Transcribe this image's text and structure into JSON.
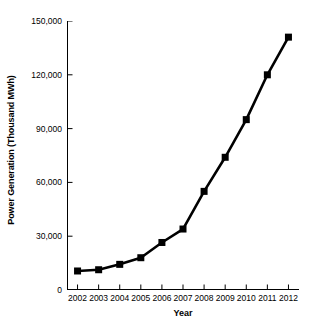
{
  "chart_data": {
    "type": "line",
    "title": "",
    "subtitle": "",
    "xlabel": "Year",
    "ylabel": "Power Generation (Thousand MWh)",
    "categories": [
      "2002",
      "2003",
      "2004",
      "2005",
      "2006",
      "2007",
      "2008",
      "2009",
      "2010",
      "2011",
      "2012"
    ],
    "x": [
      2002,
      2003,
      2004,
      2005,
      2006,
      2007,
      2008,
      2009,
      2010,
      2011,
      2012
    ],
    "values": [
      10600,
      11300,
      14300,
      18000,
      26500,
      34000,
      55000,
      74000,
      95000,
      120000,
      141000
    ],
    "series": [
      {
        "name": "Power Generation",
        "values": [
          10600,
          11300,
          14300,
          18000,
          26500,
          34000,
          55000,
          74000,
          95000,
          120000,
          141000
        ]
      }
    ],
    "ylim": [
      0,
      150000
    ],
    "xlim": [
      2001.5,
      2012.5
    ],
    "ytick_values": [
      0,
      30000,
      60000,
      90000,
      120000,
      150000
    ],
    "ytick_labels": [
      "0",
      "30,000",
      "60,000",
      "90,000",
      "120,000",
      "150,000"
    ],
    "xtick_labels": [
      "2002",
      "2003",
      "2004",
      "2005",
      "2006",
      "2007",
      "2008",
      "2009",
      "2010",
      "2011",
      "2012"
    ],
    "grid": false,
    "legend": false,
    "legend_position": "none",
    "marker": "square",
    "line_color": "#000000",
    "marker_color": "#000000",
    "background_color": "#ffffff",
    "axis_color": "#000000"
  }
}
